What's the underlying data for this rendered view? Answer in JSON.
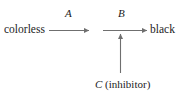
{
  "diagram": {
    "type": "reaction-scheme",
    "stroke_color": "#6f6f6f",
    "text_color": "#1c1c1c",
    "background_color": "#ffffff",
    "nodes": [
      {
        "id": "reactant",
        "label": "colorless"
      },
      {
        "id": "product",
        "label": "black"
      },
      {
        "id": "inhibitor",
        "symbol": "C",
        "qualifier": "(inhibitor)",
        "label": "C (inhibitor)"
      }
    ],
    "arrows": [
      {
        "id": "step-a",
        "label": "A",
        "direction": "right",
        "from": "colorless",
        "to": "intermediate"
      },
      {
        "id": "step-b",
        "label": "B",
        "direction": "right",
        "from": "intermediate",
        "to": "black"
      },
      {
        "id": "inhibition",
        "label": "",
        "direction": "up",
        "from": "C (inhibitor)",
        "to": "step-b"
      }
    ]
  }
}
